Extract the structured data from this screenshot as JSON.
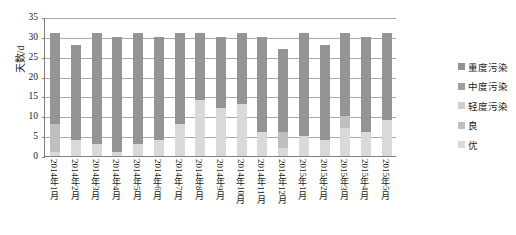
{
  "chart_data": {
    "type": "bar",
    "stacked": true,
    "title": "",
    "xlabel": "",
    "ylabel": "天数/d",
    "ylim": [
      0,
      35
    ],
    "yticks": [
      0,
      5,
      10,
      15,
      20,
      25,
      30,
      35
    ],
    "grid": true,
    "legend_position": "right",
    "categories": [
      "2014年1月",
      "2014年2月",
      "2014年3月",
      "2014年4月",
      "2014年5月",
      "2014年6月",
      "2014年7月",
      "2014年8月",
      "2014年9月",
      "2014年10月",
      "2014年11月",
      "2014年12月",
      "2015年1月",
      "2015年2月",
      "2015年3月",
      "2015年4月",
      "2015年5月"
    ],
    "series": [
      {
        "name": "优",
        "color": "#d9d9d9",
        "values": [
          1,
          4,
          3,
          1,
          3,
          4,
          8,
          14,
          12,
          13,
          6,
          2,
          5,
          4,
          7,
          6,
          9
        ]
      },
      {
        "name": "良",
        "color": "#bfbfbf",
        "values": [
          7,
          0,
          0,
          0,
          0,
          0,
          0,
          0,
          0,
          0,
          0,
          4,
          0,
          0,
          3,
          0,
          0
        ]
      },
      {
        "name": "轻度污染",
        "color": "#d0d0d0",
        "values": [
          0,
          0,
          0,
          0,
          0,
          0,
          0,
          0,
          0,
          0,
          0,
          0,
          0,
          0,
          0,
          0,
          0
        ]
      },
      {
        "name": "中度污染",
        "color": "#9e9e9e",
        "values": [
          0,
          0,
          0,
          0,
          0,
          0,
          0,
          0,
          0,
          0,
          0,
          0,
          0,
          0,
          0,
          0,
          0
        ]
      },
      {
        "name": "重度污染",
        "color": "#949494",
        "values": [
          23,
          24,
          28,
          29,
          28,
          26,
          23,
          17,
          18,
          18,
          24,
          21,
          26,
          24,
          21,
          24,
          22
        ]
      }
    ],
    "legend_entries": [
      "重度污染",
      "中度污染",
      "轻度污染",
      "良",
      "优"
    ],
    "legend_colors": [
      "#949494",
      "#9e9e9e",
      "#d0d0d0",
      "#bfbfbf",
      "#d9d9d9"
    ],
    "totals": [
      31,
      28,
      31,
      30,
      31,
      30,
      31,
      31,
      30,
      31,
      30,
      31,
      31,
      28,
      31,
      30,
      31
    ]
  },
  "caption": ""
}
